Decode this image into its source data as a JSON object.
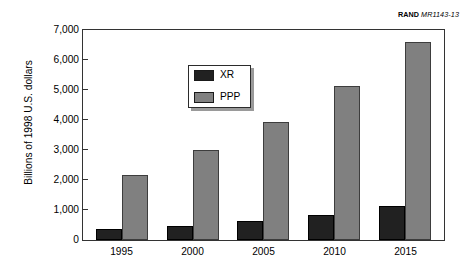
{
  "credit": {
    "org": "RAND",
    "code": "MR1143-13"
  },
  "legend": {
    "position": "top-left-inside",
    "items": [
      {
        "label": "XR",
        "color": "#212121"
      },
      {
        "label": "PPP",
        "color": "#808080"
      }
    ]
  },
  "axes": {
    "ylabel": "Billions of 1998 U.S. dollars",
    "xlabel": "",
    "yticks": [
      "7,000",
      "6,000",
      "5,000",
      "4,000",
      "3,000",
      "2,000",
      "1,000",
      "0"
    ]
  },
  "chart_data": {
    "type": "bar",
    "title": "",
    "subtitle": "",
    "xlabel": "",
    "ylabel": "Billions of 1998 U.S. dollars",
    "categories": [
      "1995",
      "2000",
      "2005",
      "2010",
      "2015"
    ],
    "series": [
      {
        "name": "XR",
        "color": "#212121",
        "values": [
          360,
          470,
          640,
          830,
          1120
        ]
      },
      {
        "name": "PPP",
        "color": "#808080",
        "values": [
          2180,
          3000,
          3950,
          5150,
          6600
        ]
      }
    ],
    "ylim": [
      0,
      7000
    ],
    "ytick_values": [
      0,
      1000,
      2000,
      3000,
      4000,
      5000,
      6000,
      7000
    ],
    "grid": false,
    "legend_position": "upper left",
    "annotations": [
      "RAND MR1143-13"
    ]
  }
}
